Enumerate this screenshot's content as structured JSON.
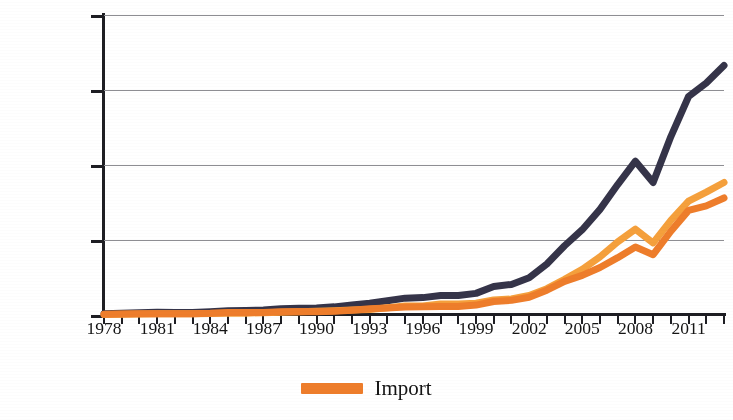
{
  "chart_data": {
    "type": "line",
    "title": "",
    "subtitle": "",
    "xlabel": "",
    "ylabel": "",
    "x": [
      1978,
      1979,
      1980,
      1981,
      1982,
      1983,
      1984,
      1985,
      1986,
      1987,
      1988,
      1989,
      1990,
      1991,
      1992,
      1993,
      1994,
      1995,
      1996,
      1997,
      1998,
      1999,
      2000,
      2001,
      2002,
      2003,
      2004,
      2005,
      2006,
      2007,
      2008,
      2009,
      2010,
      2011,
      2012,
      2013
    ],
    "xlim": [
      1978,
      2013
    ],
    "ylim": [
      0,
      5000000
    ],
    "ytick_labels": [
      "0",
      "1250000",
      "2500000",
      "3750000",
      "5000000"
    ],
    "ytick_values": [
      0,
      1250000,
      2500000,
      3750000,
      5000000
    ],
    "xtick_labels": [
      "1978",
      "1981",
      "1984",
      "1987",
      "1990",
      "1993",
      "1996",
      "1999",
      "2002",
      "2005",
      "2008",
      "2011"
    ],
    "xtick_values": [
      1978,
      1981,
      1984,
      1987,
      1990,
      1993,
      1996,
      1999,
      2002,
      2005,
      2008,
      2011
    ],
    "grid": true,
    "grid_axis": "y",
    "legend_position": "bottom-center",
    "series": [
      {
        "name": "Total",
        "color": "#353449",
        "width": 7,
        "values": [
          20600,
          29300,
          38100,
          44000,
          41600,
          43600,
          53500,
          69600,
          73800,
          82700,
          102800,
          111700,
          115400,
          135600,
          165500,
          195700,
          236200,
          280900,
          289800,
          325200,
          324000,
          360600,
          474300,
          509700,
          620800,
          851000,
          1154500,
          1421900,
          1760600,
          2173800,
          2563300,
          2207500,
          2974000,
          3641500,
          3867100,
          4158000
        ]
      },
      {
        "name": "Import",
        "color": "#EE7D2B",
        "width": 7,
        "values": [
          10900,
          15700,
          20000,
          22000,
          19300,
          21400,
          27400,
          42300,
          42900,
          43200,
          55300,
          59100,
          53400,
          63800,
          80600,
          104000,
          115600,
          132100,
          138800,
          142400,
          140200,
          165700,
          225100,
          243600,
          295200,
          412800,
          561400,
          660000,
          791500,
          956100,
          1132600,
          1005600,
          1396000,
          1743500,
          1818100,
          1950000
        ]
      },
      {
        "name": "Export",
        "color": "#F5A03C",
        "width": 7,
        "values": [
          9700,
          13600,
          18100,
          22000,
          22300,
          22200,
          26100,
          27300,
          30900,
          39400,
          47500,
          52500,
          62000,
          71800,
          84900,
          91700,
          121000,
          148800,
          151000,
          182700,
          183800,
          194900,
          249200,
          266100,
          325600,
          438200,
          593100,
          762000,
          969100,
          1217800,
          1430700,
          1201700,
          1578000,
          1898000,
          2048900,
          2208000
        ]
      }
    ],
    "legend": [
      {
        "label": "Import",
        "color": "#EE7D2B"
      }
    ]
  },
  "axes": {
    "y_labels": [
      "5000000",
      "3750000",
      "2500000",
      "1250000",
      "0"
    ],
    "x_labels": [
      "1978",
      "1981",
      "1984",
      "1987",
      "1990",
      "1993",
      "1996",
      "1999",
      "2002",
      "2005",
      "2008",
      "2011"
    ]
  },
  "legend": {
    "items": [
      {
        "label": "Import",
        "color": "#EE7D2B"
      }
    ]
  },
  "colors": {
    "total_line": "#353449",
    "import_line": "#EE7D2B",
    "export_line": "#F5A03C",
    "axis": "#1e1e23",
    "grid": "#8e8e93",
    "background": "#ffffff",
    "text": "#141414"
  }
}
